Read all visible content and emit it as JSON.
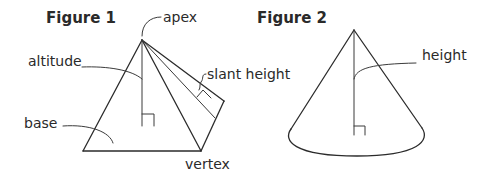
{
  "figures": [
    {
      "title": "Figure 1",
      "shape": "pyramid",
      "labels": {
        "apex": "apex",
        "altitude": "altitude",
        "slant_height": "slant height",
        "base": "base",
        "vertex": "vertex"
      }
    },
    {
      "title": "Figure 2",
      "shape": "cone",
      "labels": {
        "height": "height"
      }
    }
  ],
  "colors": {
    "line": "#2b2b2b",
    "text": "#2a2a2a",
    "background": "#ffffff"
  }
}
